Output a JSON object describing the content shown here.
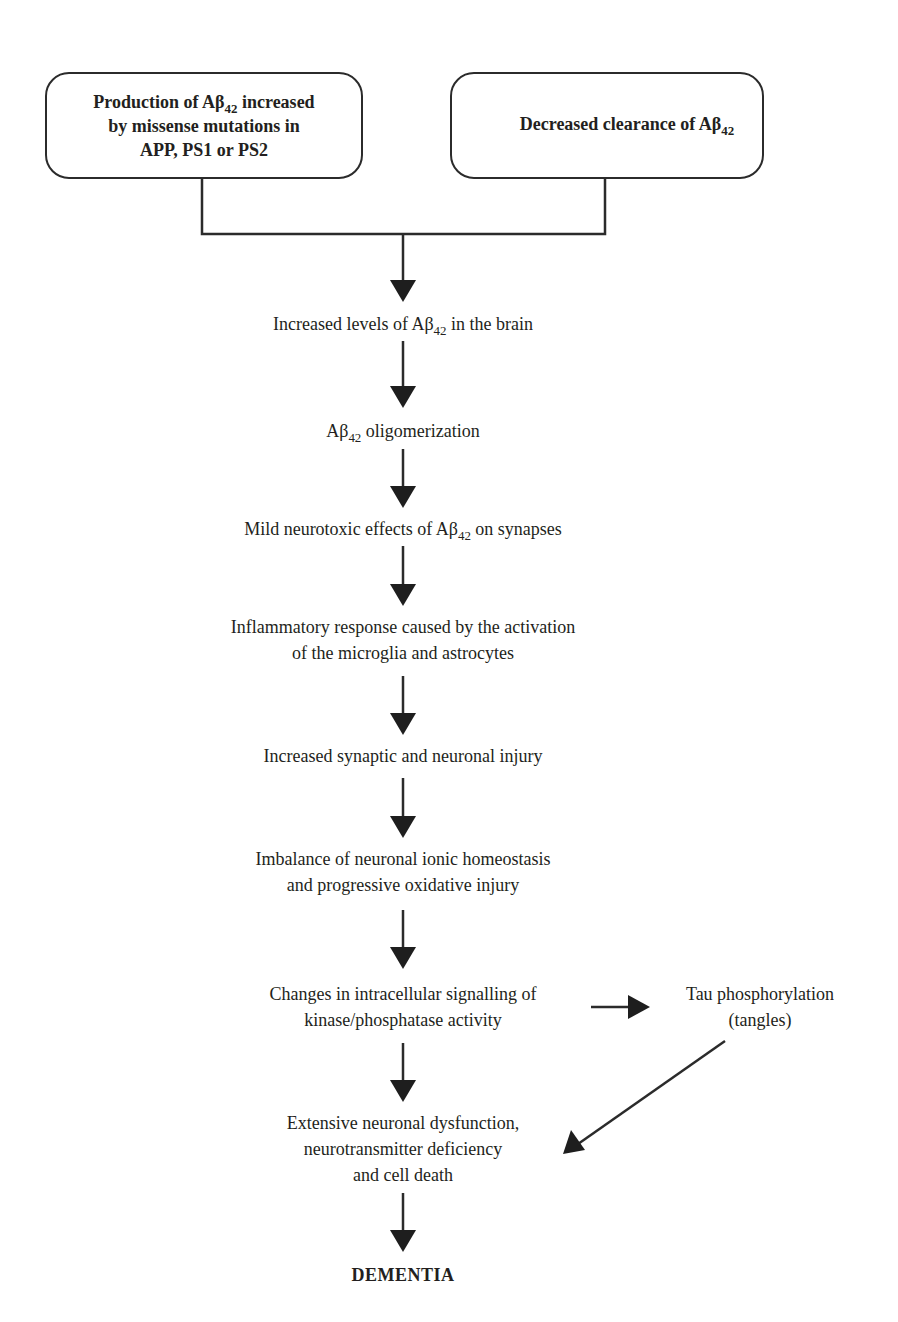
{
  "diagram": {
    "type": "flowchart",
    "colors": {
      "stroke": "#2b2b2b",
      "text": "#231f20",
      "background": "#ffffff"
    },
    "source_boxes": [
      {
        "id": "production",
        "lines": [
          {
            "pre": "Production of Aβ",
            "sub": "42",
            "post": " increased"
          },
          {
            "pre": "by missense mutations in",
            "sub": "",
            "post": ""
          },
          {
            "pre": "APP, PS1 or PS2",
            "sub": "",
            "post": ""
          }
        ]
      },
      {
        "id": "clearance",
        "lines": [
          {
            "pre": "Decreased clearance of Aβ",
            "sub": "42",
            "post": ""
          }
        ]
      }
    ],
    "steps": [
      {
        "id": "increased-levels",
        "lines": [
          {
            "pre": "Increased levels of Aβ",
            "sub": "42",
            "post": " in the brain"
          }
        ]
      },
      {
        "id": "oligomerization",
        "lines": [
          {
            "pre": "Aβ",
            "sub": "42",
            "post": " oligomerization"
          }
        ]
      },
      {
        "id": "neurotoxic-effects",
        "lines": [
          {
            "pre": "Mild neurotoxic effects of Aβ",
            "sub": "42",
            "post": " on synapses"
          }
        ]
      },
      {
        "id": "inflammatory-response",
        "lines": [
          {
            "pre": "Inflammatory response caused by the activation",
            "sub": "",
            "post": ""
          },
          {
            "pre": "of the microglia and astrocytes",
            "sub": "",
            "post": ""
          }
        ]
      },
      {
        "id": "synaptic-injury",
        "lines": [
          {
            "pre": "Increased synaptic and neuronal injury",
            "sub": "",
            "post": ""
          }
        ]
      },
      {
        "id": "ionic-imbalance",
        "lines": [
          {
            "pre": "Imbalance of neuronal ionic homeostasis",
            "sub": "",
            "post": ""
          },
          {
            "pre": "and progressive oxidative injury",
            "sub": "",
            "post": ""
          }
        ]
      },
      {
        "id": "signalling-changes",
        "lines": [
          {
            "pre": "Changes in intracellular signalling of",
            "sub": "",
            "post": ""
          },
          {
            "pre": "kinase/phosphatase activity",
            "sub": "",
            "post": ""
          }
        ]
      },
      {
        "id": "neuronal-dysfunction",
        "lines": [
          {
            "pre": "Extensive neuronal dysfunction,",
            "sub": "",
            "post": ""
          },
          {
            "pre": "neurotransmitter deficiency",
            "sub": "",
            "post": ""
          },
          {
            "pre": "and cell death",
            "sub": "",
            "post": ""
          }
        ]
      }
    ],
    "side_node": {
      "id": "tau",
      "lines": [
        {
          "pre": "Tau phosphorylation",
          "sub": "",
          "post": ""
        },
        {
          "pre": "(tangles)",
          "sub": "",
          "post": ""
        }
      ]
    },
    "outcome": {
      "id": "dementia",
      "label": "DEMENTIA"
    },
    "edges": [
      {
        "from": "production",
        "to": "increased-levels"
      },
      {
        "from": "clearance",
        "to": "increased-levels"
      },
      {
        "from": "increased-levels",
        "to": "oligomerization"
      },
      {
        "from": "oligomerization",
        "to": "neurotoxic-effects"
      },
      {
        "from": "neurotoxic-effects",
        "to": "inflammatory-response"
      },
      {
        "from": "inflammatory-response",
        "to": "synaptic-injury"
      },
      {
        "from": "synaptic-injury",
        "to": "ionic-imbalance"
      },
      {
        "from": "ionic-imbalance",
        "to": "signalling-changes"
      },
      {
        "from": "signalling-changes",
        "to": "tau"
      },
      {
        "from": "signalling-changes",
        "to": "neuronal-dysfunction"
      },
      {
        "from": "tau",
        "to": "neuronal-dysfunction"
      },
      {
        "from": "neuronal-dysfunction",
        "to": "dementia"
      }
    ]
  }
}
